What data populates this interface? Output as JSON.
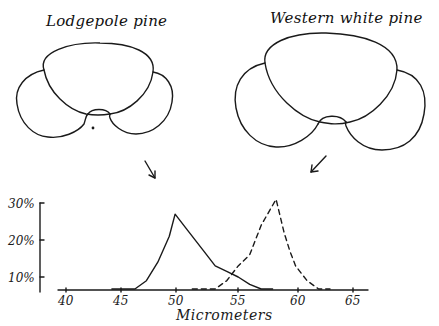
{
  "figure": {
    "left_title": "Lodgepole pine",
    "right_title": "Western white pine",
    "pollen_grains": [
      {
        "name": "Lodgepole pine",
        "arrow_points_to": "solid curve"
      },
      {
        "name": "Western white pine",
        "arrow_points_to": "dashed curve"
      }
    ]
  },
  "chart_data": {
    "type": "line",
    "title": "",
    "xlabel": "Micrometers",
    "ylabel": "",
    "xlim": [
      40,
      65
    ],
    "ylim": [
      0,
      30
    ],
    "x_ticks": [
      "40",
      "45",
      "50",
      "55",
      "60",
      "65"
    ],
    "y_ticks": [
      "10%",
      "20%",
      "30%"
    ],
    "grid": false,
    "legend": "none (curves identified by arrows from pollen drawings)",
    "series": [
      {
        "name": "Lodgepole pine",
        "style": "solid",
        "x": [
          44,
          45,
          46,
          47,
          48,
          49,
          49.5,
          50.5,
          52,
          53,
          54,
          55,
          56,
          57,
          58
        ],
        "y": [
          0.5,
          3,
          5.5,
          9,
          14,
          21,
          27,
          23,
          17,
          13,
          11.5,
          10,
          8,
          5,
          0.5
        ]
      },
      {
        "name": "Western white pine",
        "style": "dashed",
        "x": [
          51,
          52,
          53,
          54,
          55,
          56,
          57,
          58.3,
          59,
          59.5,
          60,
          61,
          62,
          63
        ],
        "y": [
          0.5,
          2,
          5,
          9,
          13,
          16,
          24,
          31,
          22,
          17,
          13,
          9,
          5,
          0.5
        ]
      }
    ]
  }
}
